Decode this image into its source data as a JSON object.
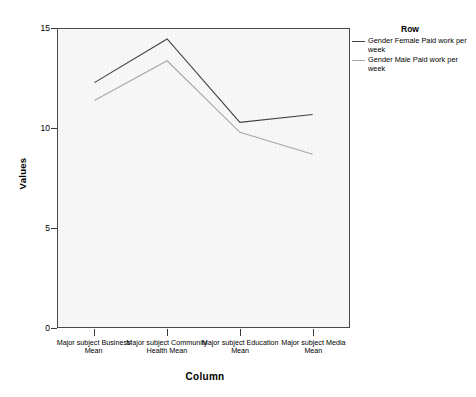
{
  "chart_data": {
    "type": "line",
    "title": "",
    "xlabel": "Column",
    "ylabel": "Values",
    "categories": [
      "Major subject Business Mean",
      "Major subject Community Health Mean",
      "Major subject Education Mean",
      "Major subject Media Mean"
    ],
    "series": [
      {
        "name": "Gender Female Paid work per week",
        "values": [
          12.3,
          14.5,
          10.3,
          10.7
        ],
        "color": "#404040"
      },
      {
        "name": "Gender Male Paid work per week",
        "values": [
          11.4,
          13.4,
          9.8,
          8.7
        ],
        "color": "#a8a8a8"
      }
    ],
    "ylim": [
      0,
      15
    ],
    "yticks": [
      0,
      5,
      10,
      15
    ],
    "ytick_labels": [
      "0",
      "5",
      "10",
      "15"
    ],
    "grid": false,
    "legend_position": "right",
    "legend_title": "Row",
    "plot_background": "#f5f5f5",
    "axis_color": "#3a3a3a"
  },
  "axes": {
    "y_title": "Values",
    "x_title": "Column"
  },
  "legend": {
    "title": "Row",
    "entries": [
      {
        "label": "Gender Female Paid work per week"
      },
      {
        "label": "Gender Male Paid work per week"
      }
    ]
  }
}
